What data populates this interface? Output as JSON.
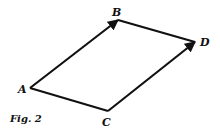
{
  "figure": {
    "caption": "Fig. 2",
    "points": {
      "A": {
        "label": "A",
        "x": 30,
        "y": 88
      },
      "B": {
        "label": "B",
        "x": 118,
        "y": 20
      },
      "C": {
        "label": "C",
        "x": 108,
        "y": 111
      },
      "D": {
        "label": "D",
        "x": 195,
        "y": 42
      }
    },
    "edges": [
      {
        "from": "A",
        "to": "B",
        "arrow": true
      },
      {
        "from": "B",
        "to": "D",
        "arrow": false
      },
      {
        "from": "A",
        "to": "C",
        "arrow": false
      },
      {
        "from": "C",
        "to": "D",
        "arrow": true
      }
    ],
    "stroke_color": "#111111"
  }
}
